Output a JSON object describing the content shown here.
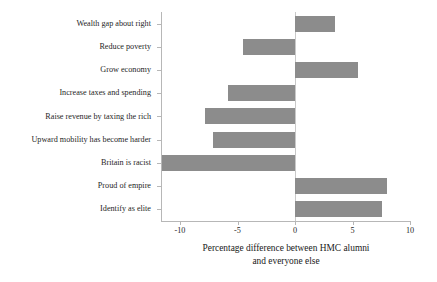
{
  "chart_data": {
    "type": "bar",
    "orientation": "horizontal",
    "title": "",
    "xlabel": "Percentage difference between HMC alumni and everyone else",
    "xlabel_line1": "Percentage difference between HMC alumni",
    "xlabel_line2": "and everyone else",
    "ylabel": "",
    "xlim": [
      -11.8,
      10
    ],
    "xticks": [
      -10,
      -5,
      0,
      5,
      10
    ],
    "xtick_labels": [
      "-10",
      "-5",
      "0",
      "5",
      "10"
    ],
    "grid": false,
    "legend": false,
    "bar_color": "#8c8c8c",
    "axis_color": "#b7b7b7",
    "categories": [
      "Wealth gap about right",
      "Reduce poverty",
      "Grow economy",
      "Increase taxes and spending",
      "Raise revenue by taxing the rich",
      "Upward mobility has become harder",
      "Britain is racist",
      "Proud of empire",
      "Identify as elite"
    ],
    "values": [
      3.5,
      -4.5,
      5.5,
      -5.8,
      -7.8,
      -7.1,
      -11.6,
      8.0,
      7.6
    ]
  }
}
